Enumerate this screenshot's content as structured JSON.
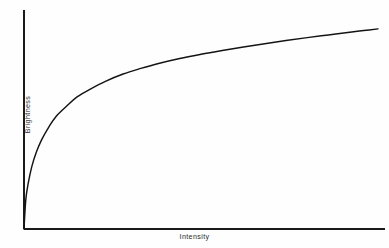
{
  "figure": {
    "background_color": "#fefefe",
    "line_color": "#141414",
    "axis_color": "#1a1a1a",
    "text_color": "#2b2b2b"
  },
  "axes": {
    "x_axis_name": "x-axis",
    "y_axis_name": "y-axis"
  },
  "chart_data": {
    "type": "line",
    "title": "",
    "subtitle": "",
    "xlabel": "Intensity",
    "ylabel": "Brightness",
    "grid": false,
    "legend": null,
    "legend_position": "none",
    "xlim": [
      0,
      1
    ],
    "ylim": [
      0,
      1
    ],
    "x_tick_labels": [],
    "y_tick_labels": [],
    "annotations": [],
    "series": [
      {
        "name": "brightness response",
        "x": [
          0.0,
          0.005,
          0.012,
          0.022,
          0.035,
          0.05,
          0.07,
          0.09,
          0.12,
          0.15,
          0.19,
          0.23,
          0.28,
          0.33,
          0.38,
          0.44,
          0.5,
          0.56,
          0.62,
          0.68,
          0.74,
          0.8,
          0.86,
          0.92,
          0.96,
          1.0
        ],
        "y": [
          0.0,
          0.14,
          0.22,
          0.3,
          0.37,
          0.43,
          0.49,
          0.54,
          0.59,
          0.635,
          0.675,
          0.71,
          0.745,
          0.772,
          0.796,
          0.82,
          0.84,
          0.858,
          0.875,
          0.891,
          0.906,
          0.92,
          0.933,
          0.946,
          0.954,
          0.962
        ]
      }
    ]
  }
}
